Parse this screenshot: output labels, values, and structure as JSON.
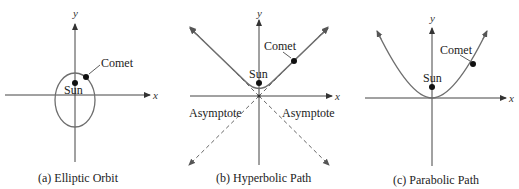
{
  "colors": {
    "axis": "#444444",
    "curve": "#6e6e6e",
    "dot": "#111111",
    "text": "#222222"
  },
  "panels": [
    {
      "id": "a",
      "caption": "(a) Elliptic Orbit",
      "shape": "ellipse",
      "axis_labels": {
        "x": "x",
        "y": "y"
      },
      "sun_label": "Sun",
      "comet_label": "Comet"
    },
    {
      "id": "b",
      "caption": "(b) Hyperbolic Path",
      "shape": "hyperbola",
      "axis_labels": {
        "x": "x",
        "y": "y"
      },
      "sun_label": "Sun",
      "comet_label": "Comet",
      "asymptote_labels": [
        "Asymptote",
        "Asymptote"
      ]
    },
    {
      "id": "c",
      "caption": "(c) Parabolic Path",
      "shape": "parabola",
      "axis_labels": {
        "x": "x",
        "y": "y"
      },
      "sun_label": "Sun",
      "comet_label": "Comet"
    }
  ]
}
